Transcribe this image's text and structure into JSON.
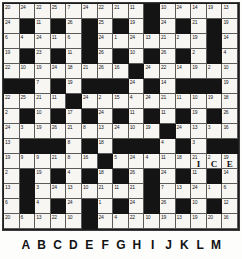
{
  "puzzle": {
    "type": "codeword",
    "title": "Codeword Grid",
    "rows": 15,
    "cols": 15,
    "colors": {
      "block": "#141414",
      "open": "#f7f6f2",
      "grid_line": "#5a5a5a",
      "text": "#20201e"
    },
    "column_labels": [
      "",
      "A",
      "B",
      "C",
      "D",
      "E",
      "F",
      "G",
      "H",
      "I",
      "J",
      "K",
      "L",
      "M",
      ""
    ],
    "grid": [
      [
        {
          "n": "20"
        },
        {
          "n": "24"
        },
        {
          "n": "22"
        },
        {
          "n": "25"
        },
        {
          "n": "7"
        },
        {
          "n": "24"
        },
        {
          "n": "22"
        },
        {
          "n": "21"
        },
        {
          "n": "11"
        },
        {
          "block": true
        },
        {
          "n": "10"
        },
        {
          "n": "24"
        },
        {
          "n": "14"
        },
        {
          "n": "19"
        },
        {
          "n": "13"
        }
      ],
      [
        {
          "n": "24"
        },
        {
          "block": true
        },
        {
          "n": "11"
        },
        {
          "block": true
        },
        {
          "n": "26"
        },
        {
          "block": true
        },
        {
          "n": "25"
        },
        {
          "block": true
        },
        {
          "n": "19"
        },
        {
          "block": true
        },
        {
          "n": "24"
        },
        {
          "block": true
        },
        {
          "n": "21"
        },
        {
          "block": true
        },
        {
          "n": "19"
        }
      ],
      [
        {
          "n": "6"
        },
        {
          "n": "4"
        },
        {
          "n": "24"
        },
        {
          "n": "11"
        },
        {
          "n": "6"
        },
        {
          "block": true
        },
        {
          "n": "24"
        },
        {
          "n": "1"
        },
        {
          "n": "24"
        },
        {
          "n": "13"
        },
        {
          "n": "21"
        },
        {
          "n": "2"
        },
        {
          "n": "19"
        },
        {
          "block": true
        },
        {
          "n": "14"
        }
      ],
      [
        {
          "n": "19"
        },
        {
          "block": true
        },
        {
          "n": "23"
        },
        {
          "block": true
        },
        {
          "n": "11"
        },
        {
          "block": true
        },
        {
          "n": "26"
        },
        {
          "block": true
        },
        {
          "n": "10"
        },
        {
          "block": true
        },
        {
          "n": "26"
        },
        {
          "block": true
        },
        {
          "n": "2"
        },
        {
          "block": true
        },
        {
          "n": "4"
        }
      ],
      [
        {
          "n": "22"
        },
        {
          "n": "10"
        },
        {
          "n": "19"
        },
        {
          "n": "24"
        },
        {
          "n": "18"
        },
        {
          "n": "21"
        },
        {
          "n": "26"
        },
        {
          "n": "16"
        },
        {
          "block": true
        },
        {
          "n": "24"
        },
        {
          "n": "22"
        },
        {
          "n": "14"
        },
        {
          "n": "19"
        },
        {
          "n": "2"
        },
        {
          "n": "10"
        }
      ],
      [
        {
          "block": true
        },
        {
          "block": true
        },
        {
          "n": "7"
        },
        {
          "block": true
        },
        {
          "n": "19"
        },
        {
          "block": true
        },
        {
          "block": true
        },
        {
          "block": true
        },
        {
          "n": "24"
        },
        {
          "block": true
        },
        {
          "n": "14"
        },
        {
          "block": true
        },
        {
          "block": true
        },
        {
          "block": true
        },
        {
          "n": "19"
        }
      ],
      [
        {
          "n": "22"
        },
        {
          "n": "25"
        },
        {
          "n": "21"
        },
        {
          "n": "11"
        },
        {
          "block": true
        },
        {
          "n": "24"
        },
        {
          "n": "2"
        },
        {
          "n": "15"
        },
        {
          "n": "4"
        },
        {
          "n": "24"
        },
        {
          "n": "21"
        },
        {
          "n": "11"
        },
        {
          "n": "10"
        },
        {
          "n": "19"
        },
        {
          "n": "18"
        }
      ],
      [
        {
          "n": "2"
        },
        {
          "block": true
        },
        {
          "n": "10"
        },
        {
          "block": true
        },
        {
          "n": "17"
        },
        {
          "block": true
        },
        {
          "n": "24"
        },
        {
          "block": true
        },
        {
          "n": "11"
        },
        {
          "block": true
        },
        {
          "n": "11"
        },
        {
          "block": true
        },
        {
          "n": "19"
        },
        {
          "block": true
        },
        {
          "n": "26"
        }
      ],
      [
        {
          "n": "24"
        },
        {
          "n": "3"
        },
        {
          "n": "19"
        },
        {
          "n": "26"
        },
        {
          "n": "21"
        },
        {
          "n": "8"
        },
        {
          "n": "13"
        },
        {
          "n": "24"
        },
        {
          "n": "10"
        },
        {
          "n": "19"
        },
        {
          "block": true
        },
        {
          "n": "24"
        },
        {
          "n": "13"
        },
        {
          "n": "3"
        },
        {
          "n": "16"
        }
      ],
      [
        {
          "n": "13"
        },
        {
          "block": true
        },
        {
          "block": true
        },
        {
          "block": true
        },
        {
          "n": "8"
        },
        {
          "block": true
        },
        {
          "n": "18"
        },
        {
          "block": true
        },
        {
          "block": true
        },
        {
          "block": true
        },
        {
          "n": "4"
        },
        {
          "block": true
        },
        {
          "n": "3"
        },
        {
          "block": true
        },
        {
          "block": true
        }
      ],
      [
        {
          "n": "19"
        },
        {
          "n": "9"
        },
        {
          "n": "9"
        },
        {
          "n": "21"
        },
        {
          "n": "8"
        },
        {
          "n": "16"
        },
        {
          "block": true
        },
        {
          "n": "5"
        },
        {
          "n": "24"
        },
        {
          "n": "4"
        },
        {
          "n": "11"
        },
        {
          "n": "18"
        },
        {
          "n": "21",
          "letter": "I"
        },
        {
          "n": "2",
          "letter": "C"
        },
        {
          "n": "19",
          "letter": "E"
        }
      ],
      [
        {
          "n": "2"
        },
        {
          "block": true
        },
        {
          "n": "19"
        },
        {
          "block": true
        },
        {
          "n": "4"
        },
        {
          "block": true
        },
        {
          "n": "18"
        },
        {
          "block": true
        },
        {
          "n": "26"
        },
        {
          "block": true
        },
        {
          "n": "24"
        },
        {
          "block": true
        },
        {
          "n": "11"
        },
        {
          "block": true
        },
        {
          "n": "14"
        }
      ],
      [
        {
          "n": "13"
        },
        {
          "block": true
        },
        {
          "n": "3"
        },
        {
          "n": "24"
        },
        {
          "n": "13"
        },
        {
          "n": "10"
        },
        {
          "n": "21"
        },
        {
          "n": "11"
        },
        {
          "n": "21"
        },
        {
          "block": true
        },
        {
          "n": "7"
        },
        {
          "n": "13"
        },
        {
          "n": "24"
        },
        {
          "n": "1"
        },
        {
          "n": "6"
        }
      ],
      [
        {
          "n": "6"
        },
        {
          "block": true
        },
        {
          "n": "4"
        },
        {
          "block": true
        },
        {
          "n": "24"
        },
        {
          "block": true
        },
        {
          "n": "1"
        },
        {
          "block": true
        },
        {
          "n": "24"
        },
        {
          "block": true
        },
        {
          "n": "26"
        },
        {
          "block": true
        },
        {
          "n": "10"
        },
        {
          "block": true
        },
        {
          "n": "12"
        }
      ],
      [
        {
          "n": "20"
        },
        {
          "n": "6"
        },
        {
          "n": "13"
        },
        {
          "n": "22"
        },
        {
          "n": "10"
        },
        {
          "block": true
        },
        {
          "n": "24"
        },
        {
          "n": "4"
        },
        {
          "n": "22"
        },
        {
          "n": "10"
        },
        {
          "n": "19"
        },
        {
          "n": "13"
        },
        {
          "n": "19"
        },
        {
          "n": "20"
        },
        {
          "n": "16"
        }
      ]
    ]
  }
}
